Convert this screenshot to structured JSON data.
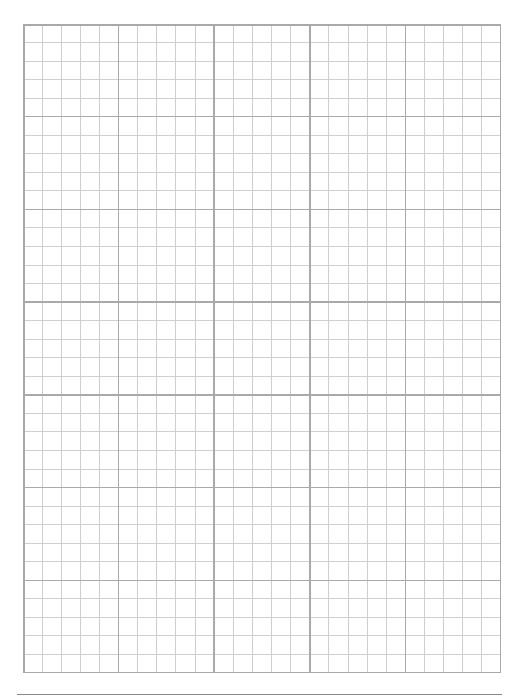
{
  "document": {
    "type": "graph-paper",
    "grid": {
      "major_columns": 5,
      "major_rows": 7,
      "minor_per_major": 5,
      "total_minor_columns": 25,
      "total_minor_rows": 35
    },
    "colors": {
      "background": "#ffffff",
      "minor_line": "#cfcfcf",
      "major_line": "#a9a9a9",
      "border_line": "#a9a9a9",
      "bottom_rule": "#8a8a8a"
    }
  }
}
